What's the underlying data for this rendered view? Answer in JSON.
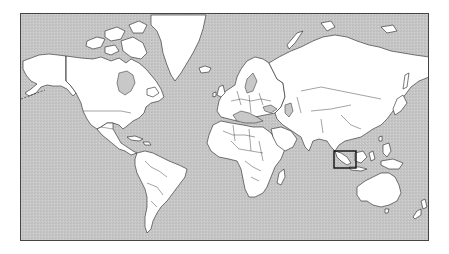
{
  "map": {
    "projection": "mercator",
    "view": "world",
    "ocean_color": "#c6c6c6",
    "land_color": "#ffffff",
    "outline_color": "#222222",
    "highlight": {
      "label": "",
      "region": "Sumatra / Java (Western Indonesia)",
      "box": {
        "x": 333,
        "y": 150,
        "width": 22,
        "height": 17
      },
      "stroke_color": "#111111"
    }
  }
}
